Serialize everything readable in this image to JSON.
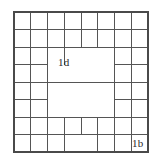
{
  "figure": {
    "type": "grid-floor-plan-diagram",
    "background_color": "#ffffff",
    "line_color": "#555555",
    "border_color": "#4a4a4a",
    "label_color": "#2a2a2a",
    "grid": {
      "columns": 8,
      "rows": 8,
      "x_start": 14,
      "y_start": 12,
      "cell_width": 16.75,
      "cell_height": 17.5,
      "x_end": 148,
      "y_end": 152
    },
    "labels": [
      {
        "id": "label-1d",
        "text": "1d",
        "x": 58,
        "y": 57
      },
      {
        "id": "label-1b",
        "text": "1b",
        "x": 132,
        "y": 138
      }
    ],
    "vertical_segments": [
      {
        "col": 0,
        "row_start": 0,
        "row_end": 8
      },
      {
        "col": 1,
        "row_start": 0,
        "row_end": 8
      },
      {
        "col": 2,
        "row_start": 0,
        "row_end": 8
      },
      {
        "col": 3,
        "row_start": 0,
        "row_end": 3
      },
      {
        "col": 3,
        "row_start": 6,
        "row_end": 8
      },
      {
        "col": 4,
        "row_start": 0,
        "row_end": 2
      },
      {
        "col": 4,
        "row_start": 6,
        "row_end": 7
      },
      {
        "col": 5,
        "row_start": 0,
        "row_end": 2
      },
      {
        "col": 5,
        "row_start": 6,
        "row_end": 8
      },
      {
        "col": 6,
        "row_start": 0,
        "row_end": 8
      },
      {
        "col": 7,
        "row_start": 0,
        "row_end": 8
      },
      {
        "col": 8,
        "row_start": 0,
        "row_end": 8
      }
    ],
    "horizontal_segments": [
      {
        "row": 0,
        "col_start": 0,
        "col_end": 8
      },
      {
        "row": 1,
        "col_start": 0,
        "col_end": 8
      },
      {
        "row": 2,
        "col_start": 0,
        "col_end": 8
      },
      {
        "row": 3,
        "col_start": 0,
        "col_end": 2
      },
      {
        "row": 3,
        "col_start": 6,
        "col_end": 8
      },
      {
        "row": 4,
        "col_start": 0,
        "col_end": 8
      },
      {
        "row": 5,
        "col_start": 0,
        "col_end": 2
      },
      {
        "row": 5,
        "col_start": 6,
        "col_end": 8
      },
      {
        "row": 6,
        "col_start": 0,
        "col_end": 8
      },
      {
        "row": 7,
        "col_start": 0,
        "col_end": 8
      },
      {
        "row": 8,
        "col_start": 0,
        "col_end": 8
      }
    ]
  }
}
